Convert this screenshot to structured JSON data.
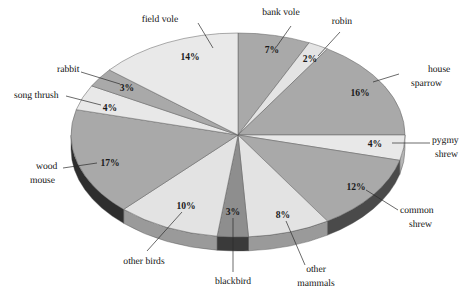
{
  "chart_data": {
    "type": "pie",
    "title": "",
    "subtitle": "",
    "xlabel": "",
    "ylabel": "",
    "legend_position": "none",
    "grid": false,
    "value_unit": "%",
    "total": 100,
    "three_d": true,
    "start_angle_deg": -90,
    "direction": "clockwise",
    "categories": [
      "bank vole",
      "robin",
      "house sparrow",
      "pygmy shrew",
      "common shrew",
      "other mammals",
      "blackbird",
      "other birds",
      "wood mouse",
      "song thrush",
      "rabbit",
      "field vole"
    ],
    "values": [
      7,
      2,
      16,
      4,
      12,
      8,
      3,
      10,
      17,
      4,
      3,
      14
    ],
    "slices": [
      {
        "label": "bank vole",
        "value": 7,
        "display": "7%",
        "color": "#a9a9a9",
        "rim_color": "#7c7c7c"
      },
      {
        "label": "robin",
        "value": 2,
        "display": "2%",
        "color": "#e4e4e4",
        "rim_color": "#b2b2b2"
      },
      {
        "label": "house sparrow",
        "value": 16,
        "display": "16%",
        "color": "#a9a9a9",
        "rim_color": "#7c7c7c"
      },
      {
        "label": "pygmy shrew",
        "value": 4,
        "display": "4%",
        "color": "#e8e8e8",
        "rim_color": "#b6b6b6"
      },
      {
        "label": "common shrew",
        "value": 12,
        "display": "12%",
        "color": "#a9a9a9",
        "rim_color": "#4a4a4a"
      },
      {
        "label": "other mammals",
        "value": 8,
        "display": "8%",
        "color": "#e3e3e3",
        "rim_color": "#9a9a9a"
      },
      {
        "label": "blackbird",
        "value": 3,
        "display": "3%",
        "color": "#8e8e8e",
        "rim_color": "#3a3a3a"
      },
      {
        "label": "other birds",
        "value": 10,
        "display": "10%",
        "color": "#e3e3e3",
        "rim_color": "#9a9a9a"
      },
      {
        "label": "wood mouse",
        "value": 17,
        "display": "17%",
        "color": "#a9a9a9",
        "rim_color": "#2e2e2e"
      },
      {
        "label": "song thrush",
        "value": 4,
        "display": "4%",
        "color": "#e8e8e8",
        "rim_color": "#b6b6b6"
      },
      {
        "label": "rabbit",
        "value": 3,
        "display": "3%",
        "color": "#a9a9a9",
        "rim_color": "#7c7c7c"
      },
      {
        "label": "field vole",
        "value": 14,
        "display": "14%",
        "color": "#e9e9e9",
        "rim_color": "#bdbdbd"
      }
    ]
  },
  "labels": {
    "bank_vole": "bank vole",
    "robin": "robin",
    "house_sparrow_line1": "house",
    "house_sparrow_line2": "sparrow",
    "pygmy_shrew_line1": "pygmy",
    "pygmy_shrew_line2": "shrew",
    "common_shrew_line1": "common",
    "common_shrew_line2": "shrew",
    "other_mammals_line1": "other",
    "other_mammals_line2": "mammals",
    "blackbird": "blackbird",
    "other_birds": "other birds",
    "wood_mouse_line1": "wood",
    "wood_mouse_line2": "mouse",
    "song_thrush": "song thrush",
    "rabbit": "rabbit",
    "field_vole": "field vole"
  },
  "percent_labels": {
    "bank_vole": "7%",
    "robin": "2%",
    "house_sparrow": "16%",
    "pygmy_shrew": "4%",
    "common_shrew": "12%",
    "other_mammals": "8%",
    "blackbird": "3%",
    "other_birds": "10%",
    "wood_mouse": "17%",
    "song_thrush": "4%",
    "rabbit": "3%",
    "field_vole": "14%"
  },
  "geometry": {
    "cx": 238,
    "cy": 135,
    "rx": 167,
    "ry": 102,
    "depth": 14
  },
  "colors": {
    "background": "#ffffff",
    "text": "#111111",
    "leader_line": "#2b2b2b",
    "light_gray": "#e8e8e8",
    "mid_gray": "#a9a9a9",
    "dark_gray": "#8e8e8e",
    "rim_dark": "#2e2e2e"
  }
}
